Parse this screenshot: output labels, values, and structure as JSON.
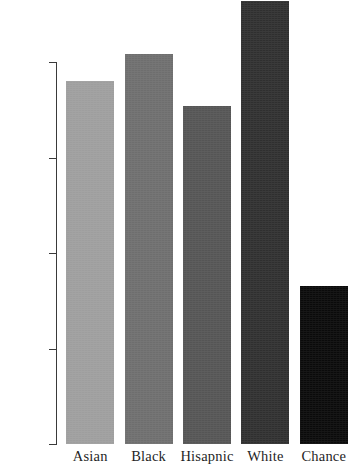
{
  "chart_data": {
    "type": "bar",
    "title": "",
    "subtitle": "",
    "xlabel": "",
    "ylabel": "",
    "categories": [
      "Asian",
      "Black",
      "Hisapnic",
      "White",
      "Chance"
    ],
    "values": [
      0.19,
      0.204,
      0.177,
      0.232,
      0.083
    ],
    "bar_colors": [
      "#9e9e9e",
      "#6e6e6e",
      "#555555",
      "#2f2f2f",
      "#0a0a0a"
    ],
    "ylim": [
      0.0,
      0.2325
    ],
    "yticks": [
      0.0,
      0.05,
      0.1,
      0.15,
      0.2
    ],
    "ytick_labels": [
      "0.00",
      "0.05",
      "0.10",
      "0.15",
      "0.20"
    ],
    "grid": false,
    "legend": false,
    "legend_position": "none",
    "annotations": []
  },
  "axis": {
    "tick_color": "#3a3a3a",
    "label_color": "#1f1f1f"
  },
  "figure": {
    "background": "#ffffff"
  }
}
